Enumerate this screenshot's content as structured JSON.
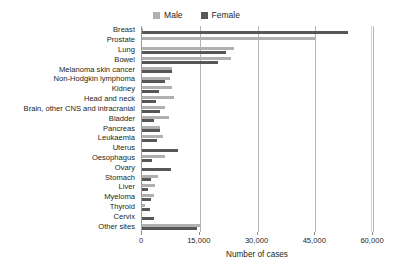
{
  "chart_data": {
    "type": "bar",
    "orientation": "horizontal",
    "title": "",
    "xlabel": "Number of cases",
    "ylabel": "",
    "xlim": [
      0,
      60000
    ],
    "xticks": [
      0,
      15000,
      30000,
      45000,
      60000
    ],
    "xticklabels": [
      "0",
      "15,000",
      "30,000",
      "45,000",
      "60,000"
    ],
    "grid": true,
    "legend_position": "top-center",
    "categories": [
      "Breast",
      "Prostate",
      "Lung",
      "Bowel",
      "Melanoma skin cancer",
      "Non-Hodgkin lymphoma",
      "Kidney",
      "Head and neck",
      "Brain, other CNS and intracranial",
      "Bladder",
      "Pancreas",
      "Leukaemia",
      "Uterus",
      "Oesophagus",
      "Ovary",
      "Stomach",
      "Liver",
      "Myeloma",
      "Thyroid",
      "Cervix",
      "Other sites"
    ],
    "series": [
      {
        "name": "Male",
        "color": "#b0b0b0",
        "values": [
          300,
          45300,
          23900,
          23100,
          7900,
          7400,
          7900,
          8200,
          5900,
          7000,
          4700,
          5500,
          0,
          6100,
          0,
          4200,
          3300,
          3100,
          800,
          0,
          15400
        ]
      },
      {
        "name": "Female",
        "color": "#575757",
        "values": [
          53500,
          0,
          21900,
          19800,
          7800,
          6100,
          4300,
          3600,
          4600,
          3100,
          4700,
          4000,
          9300,
          2600,
          7500,
          2400,
          1600,
          2300,
          2100,
          3100,
          14300
        ]
      }
    ]
  },
  "legend": {
    "entries": [
      {
        "label": "Male",
        "color": "#b0b0b0"
      },
      {
        "label": "Female",
        "color": "#575757"
      }
    ]
  }
}
